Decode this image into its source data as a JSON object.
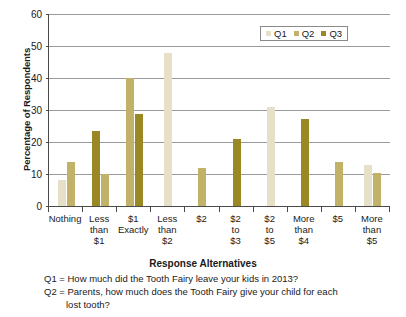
{
  "chart_data": {
    "type": "bar",
    "title": "",
    "xlabel": "Response Alternatives",
    "ylabel": "Percentage of Respondents",
    "ylim": [
      0,
      60
    ],
    "ytick_values": [
      0,
      10,
      20,
      30,
      40,
      50,
      60
    ],
    "grid": true,
    "legend_position": "top-right",
    "categories": [
      "Nothing",
      "Less than $1",
      "$1 Exactly",
      "Less than $2",
      "$2",
      "$2 to $3",
      "$2 to $5",
      "More than $4",
      "$5",
      "More than $5"
    ],
    "category_lines": [
      [
        "Nothing",
        "",
        ""
      ],
      [
        "Less",
        "than",
        "$1"
      ],
      [
        "$1",
        "Exactly",
        ""
      ],
      [
        "Less",
        "than",
        "$2"
      ],
      [
        "$2",
        "",
        ""
      ],
      [
        "$2",
        "to",
        "$3"
      ],
      [
        "$2",
        "to",
        "$5"
      ],
      [
        "More",
        "than",
        "$4"
      ],
      [
        "$5",
        "",
        ""
      ],
      [
        "More",
        "than",
        "$5"
      ]
    ],
    "series": [
      {
        "name": "Q1",
        "color": "#E6E0C8",
        "values": [
          8.2,
          null,
          null,
          47.8,
          null,
          null,
          31.0,
          null,
          null,
          12.8
        ]
      },
      {
        "name": "Q2",
        "color": "#C2B269",
        "values": [
          13.8,
          null,
          40.0,
          null,
          12.0,
          null,
          null,
          null,
          13.8,
          10.4
        ]
      },
      {
        "name": "Q3",
        "color": "#9A8824",
        "values": [
          null,
          23.4,
          28.9,
          null,
          null,
          20.8,
          null,
          27.3,
          null,
          null
        ]
      }
    ],
    "extra_bars": [
      {
        "group": 1,
        "series": "Q2",
        "value": 10.1,
        "color": "#C2B269"
      }
    ]
  },
  "axis": {
    "y_title": "Percentage of Respondents",
    "x_title": "Response Alternatives",
    "y_ticks": [
      "0",
      "10",
      "20",
      "30",
      "40",
      "50",
      "60"
    ]
  },
  "legend": {
    "items": [
      {
        "label": "Q1",
        "color": "#E6E0C8"
      },
      {
        "label": "Q2",
        "color": "#C2B269"
      },
      {
        "label": "Q3",
        "color": "#9A8824"
      }
    ]
  },
  "notes": {
    "q1": "Q1 = How much did the Tooth Fairy leave your kids in 2013?",
    "q2_line1": "Q2 = Parents, how much does the Tooth Fairy give your child for each",
    "q2_line2": "lost tooth?"
  }
}
